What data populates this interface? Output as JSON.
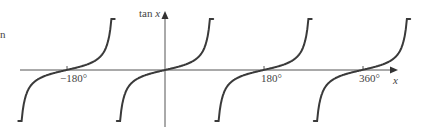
{
  "chart_data": {
    "type": "line",
    "title": "",
    "function": "tan x",
    "xlabel": "x",
    "ylabel": "tan x",
    "x_ticks": [
      {
        "value": -180,
        "label": "−180°"
      },
      {
        "value": 180,
        "label": "180°"
      },
      {
        "value": 360,
        "label": "360°"
      }
    ],
    "xlim": [
      -270,
      450
    ],
    "branch_centers": [
      -180,
      0,
      180,
      360
    ],
    "branch_half_width_deg": 88,
    "series": [
      {
        "name": "tan x",
        "x": [
          -255,
          -225,
          -180,
          -135,
          -105,
          -75,
          -45,
          0,
          45,
          75,
          105,
          135,
          180,
          225,
          255,
          285,
          315,
          360,
          405,
          435
        ],
        "values": [
          -3.73,
          -1,
          0,
          1,
          3.73,
          -3.73,
          -1,
          0,
          1,
          3.73,
          -3.73,
          -1,
          0,
          1,
          3.73,
          -3.73,
          -1,
          0,
          1,
          3.73
        ]
      }
    ],
    "grid": false,
    "legend": null
  },
  "labels": {
    "y_axis": "tan x",
    "x_axis": "x",
    "tick_neg180": "−180°",
    "tick_180": "180°",
    "tick_360": "360°",
    "margin_mark": "n"
  },
  "colors": {
    "curve": "#3a3a3a",
    "axis": "#555555",
    "text": "#444444"
  }
}
